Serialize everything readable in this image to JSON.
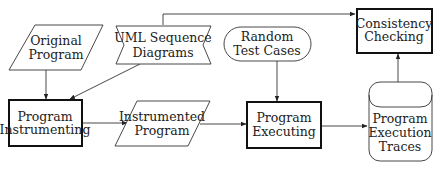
{
  "diagram": {
    "nodes": {
      "original_program": {
        "lines": [
          "Original",
          "Program"
        ],
        "shape": "parallelogram"
      },
      "uml_sequence": {
        "lines": [
          "UML Sequence",
          "Diagrams"
        ],
        "shape": "bow-flag"
      },
      "program_instrumenting": {
        "lines": [
          "Program",
          "Instrumenting"
        ],
        "shape": "process-thick"
      },
      "instrumented_program": {
        "lines": [
          "Instrumented",
          "Program"
        ],
        "shape": "parallelogram"
      },
      "random_test_cases": {
        "lines": [
          "Random",
          "Test Cases"
        ],
        "shape": "rounded-terminal"
      },
      "program_executing": {
        "lines": [
          "Program",
          "Executing"
        ],
        "shape": "process-thick"
      },
      "consistency_checking": {
        "lines": [
          "Consistency",
          "Checking"
        ],
        "shape": "process-thick"
      },
      "program_execution_traces": {
        "lines": [
          "Program",
          "Execution",
          "Traces"
        ],
        "shape": "stored-data"
      }
    },
    "edges": [
      {
        "from": "Original Program",
        "to": "Program Instrumenting"
      },
      {
        "from": "UML Sequence Diagrams",
        "to": "Program Instrumenting"
      },
      {
        "from": "UML Sequence Diagrams",
        "to": "Consistency Checking"
      },
      {
        "from": "Program Instrumenting",
        "to": "Instrumented Program"
      },
      {
        "from": "Instrumented Program",
        "to": "Program Executing"
      },
      {
        "from": "Random Test Cases",
        "to": "Program Executing"
      },
      {
        "from": "Program Executing",
        "to": "Program Execution Traces"
      },
      {
        "from": "Program Execution Traces",
        "to": "Consistency Checking"
      }
    ]
  }
}
